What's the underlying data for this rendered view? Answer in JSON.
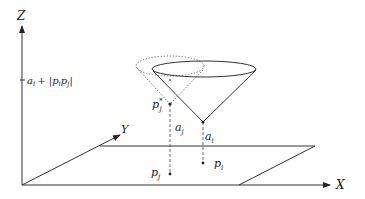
{
  "diagram": {
    "axes": {
      "z_label": "Z",
      "x_label": "X",
      "y_label": "Y",
      "z_tick_label": "a_i + |p_i p_j|"
    },
    "points": {
      "p_j_star": "p",
      "p_j_star_sub": "j",
      "p_j_star_sup": "*",
      "p_j": "p",
      "p_j_sub": "j",
      "p_i": "p",
      "p_i_sub": "i"
    },
    "heights": {
      "a_j": "a",
      "a_j_sub": "j",
      "a_i": "a",
      "a_i_sub": "i"
    },
    "tick": {
      "a": "a",
      "a_sub": "i",
      "plus": "+ |",
      "p1": "p",
      "p1_sub": "i",
      "p2": "p",
      "p2_sub": "j",
      "close": "|"
    },
    "colors": {
      "stroke": "#333333",
      "dotted": "#555555",
      "background": "#ffffff"
    }
  }
}
